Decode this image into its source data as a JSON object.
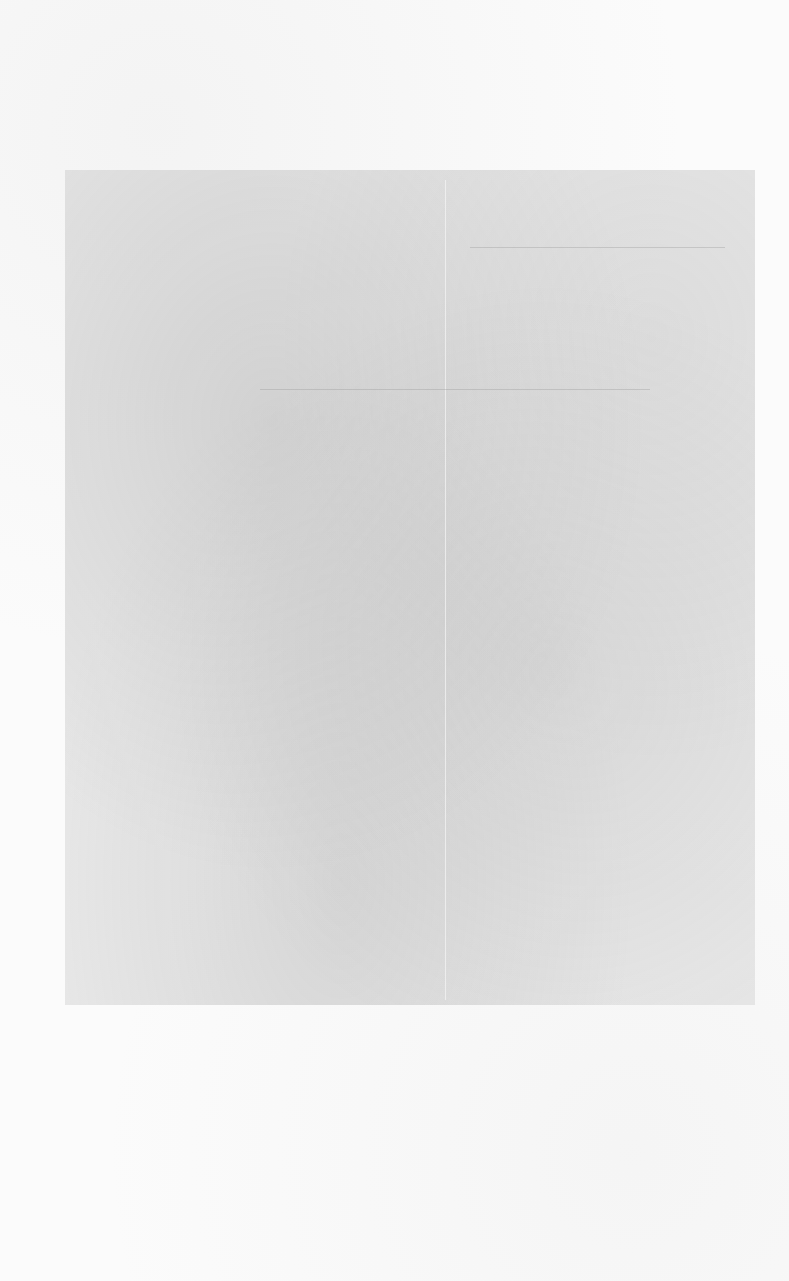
{
  "document": {
    "type": "blank-scanned-page",
    "text_content": "",
    "colors": {
      "paper": "#fbfbfb",
      "scan_tone": "#d7d7d7"
    }
  }
}
